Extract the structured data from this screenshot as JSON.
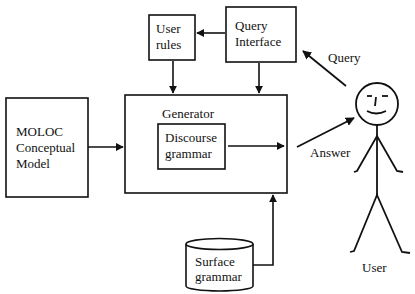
{
  "diagram": {
    "boxes": {
      "user_rules": {
        "line1": "User",
        "line2": "rules"
      },
      "query_interface": {
        "line1": "Query",
        "line2": "Interface"
      },
      "moloc": {
        "line1": "MOLOC",
        "line2": "Conceptual",
        "line3": "Model"
      },
      "generator": {
        "label": "Generator"
      },
      "discourse_grammar": {
        "line1": "Discourse",
        "line2": "grammar"
      },
      "surface_grammar": {
        "line1": "Surface",
        "line2": "grammar"
      }
    },
    "edge_labels": {
      "query": "Query",
      "answer": "Answer"
    },
    "actor": {
      "label": "User"
    },
    "colors": {
      "stroke": "#111111",
      "background": "#ffffff"
    }
  }
}
